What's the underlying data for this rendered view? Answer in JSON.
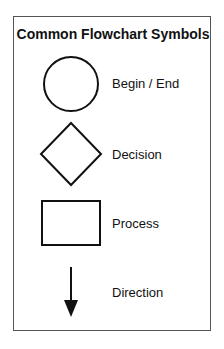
{
  "title": "Common Flowchart Symbols",
  "symbols": [
    {
      "shape": "circle",
      "label": "Begin / End"
    },
    {
      "shape": "diamond",
      "label": "Decision"
    },
    {
      "shape": "rectangle",
      "label": "Process"
    },
    {
      "shape": "arrow-down",
      "label": "Direction"
    }
  ]
}
